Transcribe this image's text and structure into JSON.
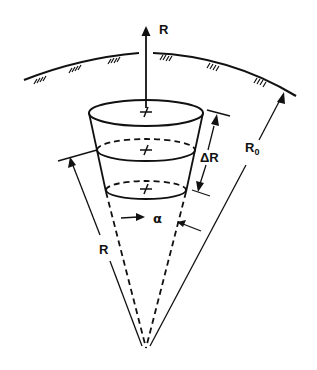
{
  "figure": {
    "labels": {
      "radial_axis": "R",
      "shell_thickness": "ΔR",
      "outer_radius_main": "R",
      "outer_radius_sub": "0",
      "inner_radius": "R",
      "cone_angle": "α"
    },
    "elements": {
      "surface": "spherical surface (hatched arc)",
      "cone": "cone with apex at center",
      "slices": 3
    },
    "colors": {
      "ink": "#111111",
      "background": "#ffffff"
    }
  }
}
